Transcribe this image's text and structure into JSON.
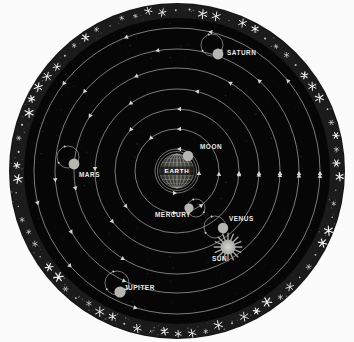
{
  "diagram": {
    "center_label": "EARTH",
    "background_color": "#fbfbfb",
    "disc_color": "#050505",
    "star_band_color": "#1a1a1a",
    "orbit_line_color": "#b9b9b4",
    "body_color": "#b6b6b0",
    "label_color": "#e9e9e6",
    "outer_radius": 168,
    "star_band_inner_radius": 154,
    "center": {
      "x": 177,
      "y": 171
    }
  },
  "bodies": [
    {
      "name": "moon",
      "label": "MOON",
      "label_x": 200,
      "label_y": 149,
      "dot_x": 188,
      "dot_y": 156,
      "dot_r": 5.2,
      "orbit_r": 22,
      "has_epicycle": false
    },
    {
      "name": "mercury",
      "label": "MERCURY",
      "label_x": 155,
      "label_y": 217,
      "dot_x": 189,
      "dot_y": 208,
      "dot_r": 4.6,
      "orbit_r": 42,
      "has_epicycle": true,
      "epicycle_x": 196,
      "epicycle_y": 208,
      "epicycle_r": 9
    },
    {
      "name": "venus",
      "label": "VENUS",
      "label_x": 229,
      "label_y": 221,
      "dot_x": 223,
      "dot_y": 228,
      "dot_r": 5.2,
      "orbit_r": 62,
      "has_epicycle": true,
      "epicycle_x": 215,
      "epicycle_y": 227,
      "epicycle_r": 11
    },
    {
      "name": "sun",
      "label": "SUN",
      "label_x": 212,
      "label_y": 261,
      "dot_x": 228,
      "dot_y": 247,
      "dot_r": 7.5,
      "orbit_r": 82,
      "has_epicycle": false,
      "is_sun": true
    },
    {
      "name": "mars",
      "label": "MARS",
      "label_x": 79,
      "label_y": 177,
      "dot_x": 74,
      "dot_y": 164,
      "dot_r": 5.4,
      "orbit_r": 103,
      "has_epicycle": true,
      "epicycle_x": 68,
      "epicycle_y": 157,
      "epicycle_r": 11
    },
    {
      "name": "jupiter",
      "label": "JUPITER",
      "label_x": 124,
      "label_y": 290,
      "dot_x": 120,
      "dot_y": 292,
      "dot_r": 5.6,
      "orbit_r": 125,
      "has_epicycle": true,
      "epicycle_x": 117,
      "epicycle_y": 283,
      "epicycle_r": 12
    },
    {
      "name": "saturn",
      "label": "SATURN",
      "label_x": 227,
      "label_y": 55,
      "dot_x": 218,
      "dot_y": 54,
      "dot_r": 5.4,
      "orbit_r": 124,
      "has_epicycle": true,
      "epicycle_x": 212,
      "epicycle_y": 45,
      "epicycle_r": 11
    }
  ],
  "orbits": {
    "radii": [
      22,
      42,
      62,
      82,
      103,
      122,
      143
    ],
    "arrow_direction": "counterclockwise"
  },
  "chart_data": {
    "type": "scatter",
    "xlabel": "",
    "ylabel": "",
    "categories": [
      "MOON",
      "MERCURY",
      "VENUS",
      "SUN",
      "MARS",
      "JUPITER",
      "SATURN"
    ],
    "values": [
      22,
      42,
      62,
      82,
      103,
      122,
      143
    ],
    "annotations": [
      "EARTH"
    ],
    "legend": [],
    "grid": false
  }
}
